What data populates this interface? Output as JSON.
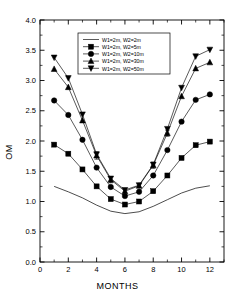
{
  "chart_data": {
    "type": "line",
    "title": "",
    "xlabel": "MONTHS",
    "ylabel": "OM",
    "xlim": [
      0,
      13
    ],
    "ylim": [
      0.0,
      4.0
    ],
    "xticks": [
      0,
      2,
      4,
      6,
      8,
      10,
      12
    ],
    "xticklabels": [
      "0",
      "2",
      "4",
      "6",
      "8",
      "10",
      "12"
    ],
    "xminorticks": [
      1,
      3,
      5,
      7,
      9,
      11,
      13
    ],
    "yticks": [
      0.0,
      0.5,
      1.0,
      1.5,
      2.0,
      2.5,
      3.0,
      3.5,
      4.0
    ],
    "yticklabels": [
      "0.0",
      "0.5",
      "1.0",
      "1.5",
      "2.0",
      "2.5",
      "3.0",
      "3.5",
      "4.0"
    ],
    "grid": false,
    "frame": "box",
    "legend_position": "upper center",
    "x": [
      1,
      2,
      3,
      4,
      5,
      6,
      7,
      8,
      9,
      10,
      11,
      12
    ],
    "series": [
      {
        "name": "W1=2m, W2=2m",
        "marker": "none",
        "values": [
          1.25,
          1.16,
          1.06,
          0.94,
          0.84,
          0.8,
          0.83,
          0.92,
          1.03,
          1.14,
          1.22,
          1.26
        ]
      },
      {
        "name": "W1=2m, W2=5m",
        "marker": "square",
        "values": [
          1.94,
          1.79,
          1.53,
          1.25,
          1.04,
          0.95,
          1.0,
          1.17,
          1.43,
          1.72,
          1.93,
          1.99
        ]
      },
      {
        "name": "W1=2m, W2=10m",
        "marker": "circle",
        "values": [
          2.67,
          2.43,
          2.02,
          1.56,
          1.24,
          1.09,
          1.16,
          1.43,
          1.85,
          2.32,
          2.68,
          2.77
        ]
      },
      {
        "name": "W1=2m, W2=30m",
        "marker": "triangle-up",
        "values": [
          3.19,
          2.89,
          2.34,
          1.76,
          1.36,
          1.17,
          1.26,
          1.6,
          2.13,
          2.74,
          3.2,
          3.3
        ],
        "errorbars": [
          0,
          0,
          0,
          0.06,
          0.05,
          0,
          0,
          0.05,
          0.05,
          0,
          0,
          0
        ]
      },
      {
        "name": "W1=2m, W2=50m",
        "marker": "triangle-down",
        "values": [
          3.38,
          3.04,
          2.44,
          1.78,
          1.38,
          1.19,
          1.27,
          1.61,
          2.2,
          2.88,
          3.4,
          3.51
        ]
      }
    ]
  },
  "axes": {
    "ylabel": "OM",
    "xlabel": "MONTHS"
  }
}
